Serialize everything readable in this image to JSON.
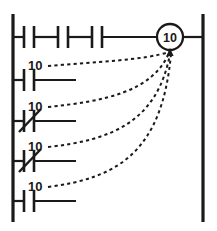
{
  "diagram": {
    "type": "ladder-logic",
    "title": "",
    "rails": {
      "left_x": 13,
      "right_x": 203,
      "top_y": 14,
      "bottom_y": 222
    },
    "coil": {
      "label": "10",
      "cx": 170,
      "cy": 37,
      "r": 13,
      "kind": "output-coil"
    },
    "rungs": [
      {
        "id": "rung-1",
        "y": 37,
        "label": "",
        "elements": [
          {
            "kind": "contact-no",
            "x": 24,
            "name": "contact-no-1"
          },
          {
            "kind": "contact-no",
            "x": 58,
            "name": "contact-no-2"
          },
          {
            "kind": "contact-no",
            "x": 92,
            "name": "contact-no-3"
          }
        ],
        "has_coil": true
      },
      {
        "id": "rung-2",
        "y": 80,
        "label": "10",
        "label_x": 28,
        "label_y": 70,
        "elements": [
          {
            "kind": "contact-no",
            "x": 24,
            "name": "contact-no-4"
          }
        ],
        "has_coil": false
      },
      {
        "id": "rung-3",
        "y": 121,
        "label": "10",
        "label_x": 28,
        "label_y": 111,
        "elements": [
          {
            "kind": "contact-nc",
            "x": 24,
            "name": "contact-nc-1"
          }
        ],
        "has_coil": false
      },
      {
        "id": "rung-4",
        "y": 161,
        "label": "10",
        "label_x": 28,
        "label_y": 151,
        "elements": [
          {
            "kind": "contact-nc",
            "x": 24,
            "name": "contact-nc-2"
          }
        ],
        "has_coil": false
      },
      {
        "id": "rung-5",
        "y": 201,
        "label": "10",
        "label_x": 28,
        "label_y": 191,
        "elements": [
          {
            "kind": "contact-no",
            "x": 24,
            "name": "contact-no-5"
          }
        ],
        "has_coil": false
      }
    ],
    "reference_links": [
      {
        "id": "link-1",
        "from_label": "10",
        "from_x": 48,
        "from_y": 66,
        "to_x": 170,
        "to_y": 51
      },
      {
        "id": "link-2",
        "from_label": "10",
        "from_x": 48,
        "from_y": 107,
        "to_x": 170,
        "to_y": 51
      },
      {
        "id": "link-3",
        "from_label": "10",
        "from_x": 48,
        "from_y": 147,
        "to_x": 170,
        "to_y": 51
      },
      {
        "id": "link-4",
        "from_label": "10",
        "from_x": 48,
        "from_y": 187,
        "to_x": 170,
        "to_y": 51
      }
    ],
    "colors": {
      "line": "#1a1a1a",
      "background": "#ffffff"
    }
  }
}
